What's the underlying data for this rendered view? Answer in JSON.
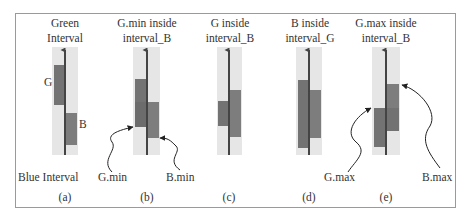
{
  "figure": {
    "colors": {
      "frame": "#9a9a9a",
      "band": "#e6e6e6",
      "green_rect": "#737373",
      "blue_rect": "#8a8a8a",
      "overlap": "#666666",
      "arrow": "#444444",
      "text": "#333333"
    },
    "panels": [
      {
        "id": "a",
        "title_lines": [
          "Green",
          "Interval"
        ],
        "caption": "(a)",
        "labels": {
          "g": "G",
          "b": "B",
          "bottom": "Blue Interval"
        }
      },
      {
        "id": "b",
        "title_lines": [
          "G.min inside",
          "interval_B"
        ],
        "caption": "(b)",
        "labels": {
          "left": "G.min",
          "right": "B.min"
        }
      },
      {
        "id": "c",
        "title_lines": [
          "G inside",
          "interval_B"
        ],
        "caption": "(c)",
        "labels": {}
      },
      {
        "id": "d",
        "title_lines": [
          "B inside",
          "interval_G"
        ],
        "caption": "(d)",
        "labels": {}
      },
      {
        "id": "e",
        "title_lines": [
          "G.max inside",
          "interval_B"
        ],
        "caption": "(e)",
        "labels": {
          "left": "G.max",
          "right": "B.max"
        }
      }
    ]
  }
}
